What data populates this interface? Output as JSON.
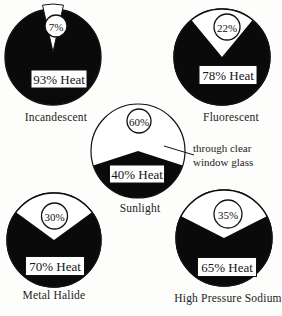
{
  "chart_data": {
    "type": "pie",
    "unit": "%",
    "colors": {
      "heat_slice": "#0a0a0a",
      "light_slice": "#ffffff",
      "outline": "#111111"
    },
    "charts": [
      {
        "label": "Incandescent",
        "light_pct": 7,
        "heat_pct": 93,
        "light_label": "7%",
        "heat_label": "93% Heat"
      },
      {
        "label": "Fluorescent",
        "light_pct": 22,
        "heat_pct": 78,
        "light_label": "22%",
        "heat_label": "78% Heat"
      },
      {
        "label": "Sunlight",
        "light_pct": 60,
        "heat_pct": 40,
        "light_label": "60%",
        "heat_label": "40% Heat",
        "annotation": "through clear window glass"
      },
      {
        "label": "Metal Halide",
        "light_pct": 30,
        "heat_pct": 70,
        "light_label": "30%",
        "heat_label": "70% Heat"
      },
      {
        "label": "High Pressure Sodium",
        "light_pct": 35,
        "heat_pct": 65,
        "light_label": "35%",
        "heat_label": "65% Heat"
      }
    ]
  },
  "annotation": {
    "lines": [
      "through clear",
      "window glass"
    ]
  }
}
